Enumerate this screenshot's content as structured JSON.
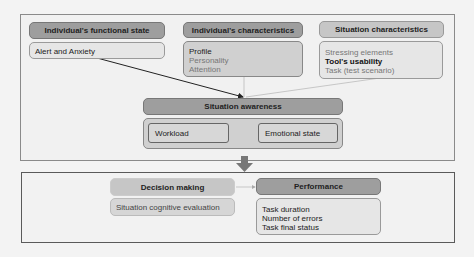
{
  "top_group": {
    "functional_state": {
      "title": "Individual's functional state",
      "items": [
        "Alert and Anxiety"
      ]
    },
    "characteristics": {
      "title": "Individual's characteristics",
      "items": [
        "Profile",
        "Personality",
        "Attention"
      ]
    },
    "situation_characteristics": {
      "title": "Situation characteristics",
      "items": [
        "Stressing elements",
        "Tool's usability",
        "Task (test scenario)"
      ]
    },
    "situation_awareness": {
      "title": "Situation awareness",
      "workload": "Workload",
      "emotional_state": "Emotional state"
    }
  },
  "bottom_group": {
    "decision_making": {
      "title": "Decision making",
      "items": [
        "Situation cognitive evaluation"
      ]
    },
    "performance": {
      "title": "Performance",
      "items": [
        "Task duration",
        "Number of errors",
        "Task final status"
      ]
    }
  },
  "colors": {
    "header_dark": "#9e9e9e",
    "header_light": "#c6c6c6",
    "frame_border": "#5a5a5a",
    "background": "#f3f3f3"
  }
}
